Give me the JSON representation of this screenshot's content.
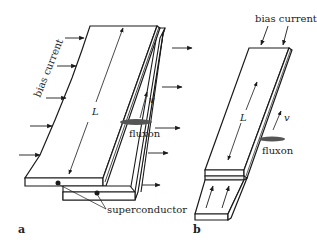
{
  "figure": {
    "panels": [
      {
        "id": "a",
        "label": "a",
        "labels": {
          "bias_current": "bias current",
          "length": "L",
          "velocity": "v",
          "fluxon": "fluxon",
          "superconductor": "superconductor"
        }
      },
      {
        "id": "b",
        "label": "b",
        "labels": {
          "bias_current": "bias current",
          "length": "L",
          "velocity": "v",
          "fluxon": "fluxon"
        }
      }
    ],
    "colors": {
      "line": "#1a1a1a",
      "fluxon_fill": "#555555",
      "background": "#ffffff"
    }
  }
}
